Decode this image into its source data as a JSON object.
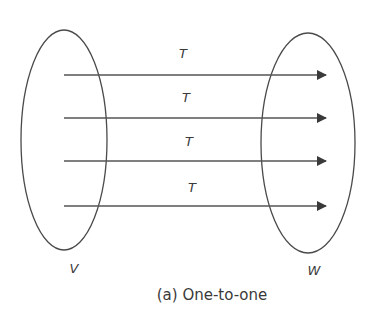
{
  "diagram": {
    "caption": "(a) One-to-one",
    "domain_set": {
      "label": "V"
    },
    "codomain_set": {
      "label": "W"
    },
    "mappings": [
      {
        "label": "T"
      },
      {
        "label": "T"
      },
      {
        "label": "T"
      },
      {
        "label": "T"
      }
    ],
    "colors": {
      "stroke": "#4a4a4a",
      "text": "#3a3a3a",
      "background": "#ffffff"
    }
  }
}
